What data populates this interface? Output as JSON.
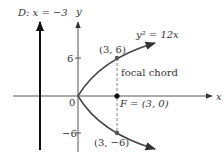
{
  "diagram": {
    "directrix_label": "D: x = −3",
    "y_axis_label": "y",
    "x_axis_label": "x",
    "equation_label": "y² = 12x",
    "origin_label": "0",
    "tick_pos_label": "6",
    "tick_neg_label": "−6",
    "point_upper_label": "(3, 6)",
    "point_lower_label": "(3, −6)",
    "focus_label": "F = (3, 0)",
    "focal_chord_label": "focal chord",
    "colors": {
      "axis": "#555555",
      "curve": "#444444",
      "directrix": "#111111",
      "text": "#333333"
    }
  }
}
